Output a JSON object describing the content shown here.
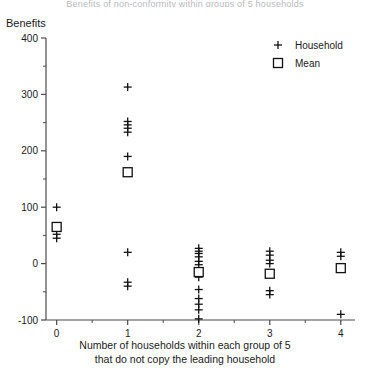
{
  "title_clipped": "Benefits of non-conformity within groups of 5 households",
  "axes": {
    "y_title": "Benefits",
    "y_ticks": [
      400,
      300,
      200,
      100,
      0,
      -100
    ],
    "y_minor_ticks": [
      350,
      250,
      150,
      50,
      -50
    ],
    "ylim": [
      -100,
      400
    ],
    "x_ticks": [
      0,
      1,
      2,
      3,
      4
    ],
    "x_minor_ticks": [
      0.5,
      1.5,
      2.5,
      3.5
    ],
    "xlim": [
      -0.15,
      4.2
    ],
    "x_caption_line1": "Number of households within each group of 5",
    "x_caption_line2": "that do not copy the leading household"
  },
  "legend": {
    "position": "top-right",
    "items": [
      {
        "marker": "plus-marker",
        "label": "Household"
      },
      {
        "marker": "square-marker",
        "label": "Mean"
      }
    ]
  },
  "colors": {
    "axis": "#4a4a4a",
    "marker": "#111111",
    "text": "#1a1a1a",
    "title_faint": "#b9b9bf"
  },
  "chart_data": {
    "type": "scatter",
    "title": "Benefits of non-conformity within groups of 5 households",
    "xlabel": "Number of households within each group of 5 that do not copy the leading household",
    "ylabel": "Benefits",
    "xlim": [
      -0.15,
      4.2
    ],
    "ylim": [
      -100,
      400
    ],
    "grid": false,
    "legend_position": "top-right",
    "series": [
      {
        "name": "Household",
        "marker": "+",
        "points": [
          {
            "x": 0,
            "y": 100
          },
          {
            "x": 0,
            "y": 52
          },
          {
            "x": 0,
            "y": 45
          },
          {
            "x": 1,
            "y": 313
          },
          {
            "x": 1,
            "y": 252
          },
          {
            "x": 1,
            "y": 246
          },
          {
            "x": 1,
            "y": 240
          },
          {
            "x": 1,
            "y": 233
          },
          {
            "x": 1,
            "y": 190
          },
          {
            "x": 1,
            "y": 163
          },
          {
            "x": 1,
            "y": 20
          },
          {
            "x": 1,
            "y": -33
          },
          {
            "x": 1,
            "y": -40
          },
          {
            "x": 2,
            "y": 27
          },
          {
            "x": 2,
            "y": 22
          },
          {
            "x": 2,
            "y": 18
          },
          {
            "x": 2,
            "y": 12
          },
          {
            "x": 2,
            "y": 4
          },
          {
            "x": 2,
            "y": -2
          },
          {
            "x": 2,
            "y": -14
          },
          {
            "x": 2,
            "y": -24
          },
          {
            "x": 2,
            "y": -46
          },
          {
            "x": 2,
            "y": -62
          },
          {
            "x": 2,
            "y": -72
          },
          {
            "x": 2,
            "y": -82
          },
          {
            "x": 2,
            "y": -98
          },
          {
            "x": 3,
            "y": 22
          },
          {
            "x": 3,
            "y": 15
          },
          {
            "x": 3,
            "y": 6
          },
          {
            "x": 3,
            "y": 0
          },
          {
            "x": 3,
            "y": -18
          },
          {
            "x": 3,
            "y": -48
          },
          {
            "x": 3,
            "y": -55
          },
          {
            "x": 4,
            "y": 20
          },
          {
            "x": 4,
            "y": 13
          },
          {
            "x": 4,
            "y": -8
          },
          {
            "x": 4,
            "y": -90
          }
        ]
      },
      {
        "name": "Mean",
        "marker": "square",
        "points": [
          {
            "x": 0,
            "y": 65
          },
          {
            "x": 1,
            "y": 162
          },
          {
            "x": 2,
            "y": -15
          },
          {
            "x": 3,
            "y": -18
          },
          {
            "x": 4,
            "y": -8
          }
        ]
      }
    ]
  }
}
